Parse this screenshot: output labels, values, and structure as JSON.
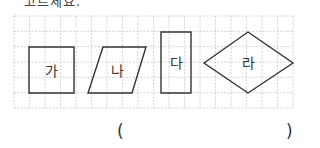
{
  "question": {
    "partial_text": "고르세요."
  },
  "grid": {
    "x0": 14,
    "y0": 16,
    "x1": 293,
    "y1": 108,
    "cols": 18,
    "rows": 6,
    "line_color": "#c8c8c8"
  },
  "shapes": [
    {
      "label": "가",
      "type": "square",
      "points": "29,47 74,47 74,93 29,93",
      "label_x": 51,
      "label_y": 76
    },
    {
      "label": "나",
      "type": "parallelogram",
      "points": "103,47 146,47 132,93 88,93",
      "label_x": 117,
      "label_y": 76
    },
    {
      "label": "다",
      "type": "rectangle",
      "points": "161,32 191,32 191,93 161,93",
      "label_x": 176,
      "label_y": 68
    },
    {
      "label": "라",
      "type": "rhombus",
      "points": "204,63 248,32 293,63 248,93",
      "label_x": 248,
      "label_y": 68
    }
  ],
  "stroke_color": "#333333",
  "answer": {
    "open_paren": "(",
    "close_paren": ")",
    "value": ""
  }
}
